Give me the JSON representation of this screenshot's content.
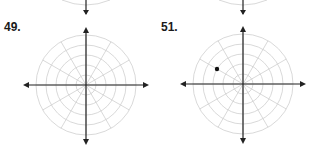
{
  "problems": [
    {
      "number": "49.",
      "center": [
        86,
        85
      ],
      "radius": 50,
      "rings": 5,
      "spokes": 12,
      "points": []
    },
    {
      "number": "51.",
      "center": [
        243,
        84
      ],
      "radius": 50,
      "rings": 5,
      "spokes": 12,
      "points": [
        [
          217,
          69
        ]
      ]
    }
  ],
  "colors": {
    "grid": "#cfcfcf",
    "axis": "#222222",
    "point": "#111111"
  }
}
